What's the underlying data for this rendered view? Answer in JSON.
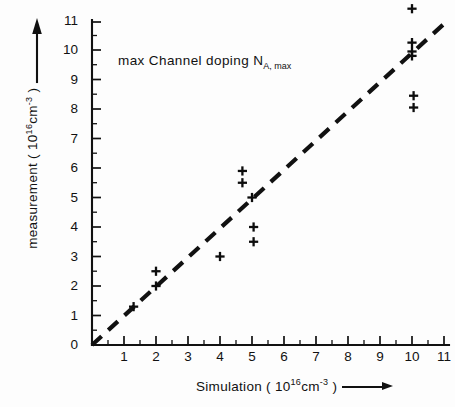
{
  "chart_data": {
    "type": "scatter",
    "title": "",
    "annotation": "max  Channel doping N",
    "annotation_subscript": "A, max",
    "xlabel": "Simulation ( 10",
    "xlabel_exponent": "16",
    "xlabel_tail": "cm",
    "xlabel_exponent2": "-3",
    "xlabel_close": " )",
    "ylabel": "measurement ( 10",
    "ylabel_exponent": "16",
    "ylabel_tail": "cm",
    "ylabel_exponent2": "-3",
    "ylabel_close": " )",
    "xlim": [
      0,
      11.6
    ],
    "ylim": [
      0,
      11.7
    ],
    "xticks": [
      0,
      1,
      2,
      3,
      4,
      5,
      6,
      7,
      8,
      9,
      10,
      11
    ],
    "yticks": [
      0,
      1,
      2,
      3,
      4,
      5,
      6,
      7,
      8,
      9,
      10,
      11
    ],
    "xtick_labels": [
      "",
      "1",
      "2",
      "3",
      "4",
      "5",
      "6",
      "7",
      "8",
      "9",
      "10",
      "11"
    ],
    "ytick_labels": [
      "0",
      "1",
      "2",
      "3",
      "4",
      "5",
      "6",
      "7",
      "8",
      "9",
      "10",
      "11"
    ],
    "origin_label": "0",
    "grid": false,
    "legend": false,
    "marker": "plus",
    "marker_color": "#0d0d0d",
    "line_color": "#111111",
    "line_style": "dashed",
    "identity_line": {
      "x": [
        0,
        11.05
      ],
      "y": [
        0,
        10.95
      ],
      "label": "1:1 identity line"
    },
    "points": [
      {
        "x": 1.3,
        "y": 1.3
      },
      {
        "x": 2.0,
        "y": 2.0
      },
      {
        "x": 2.0,
        "y": 2.5
      },
      {
        "x": 4.0,
        "y": 3.0
      },
      {
        "x": 4.7,
        "y": 5.9
      },
      {
        "x": 4.7,
        "y": 5.5
      },
      {
        "x": 5.0,
        "y": 5.0
      },
      {
        "x": 5.05,
        "y": 4.0
      },
      {
        "x": 5.05,
        "y": 3.5
      },
      {
        "x": 10.0,
        "y": 11.4
      },
      {
        "x": 10.0,
        "y": 10.25
      },
      {
        "x": 10.0,
        "y": 9.95
      },
      {
        "x": 10.0,
        "y": 9.8
      },
      {
        "x": 10.05,
        "y": 8.45
      },
      {
        "x": 10.05,
        "y": 8.05
      }
    ]
  }
}
